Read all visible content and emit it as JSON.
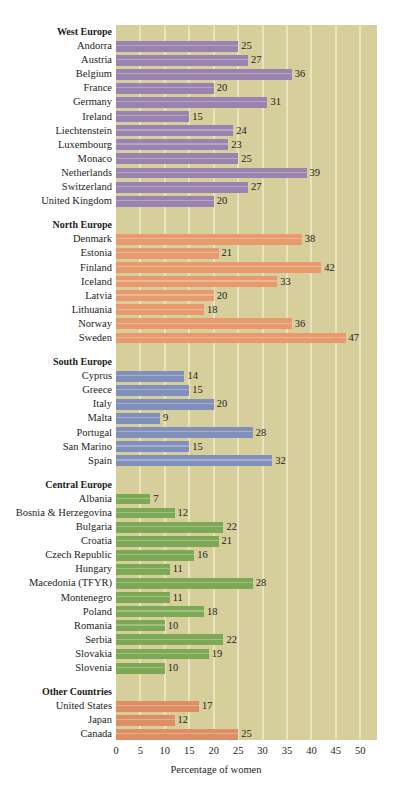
{
  "chart_data": {
    "type": "bar",
    "orientation": "horizontal",
    "title": "",
    "xlabel": "Percentage of women",
    "ylabel": "",
    "xlim": [
      0,
      50
    ],
    "xticks": [
      0,
      5,
      10,
      15,
      20,
      25,
      30,
      35,
      40,
      45,
      50
    ],
    "grid": "vertical",
    "legend": "none",
    "value_suffix": "",
    "colors": {
      "west": "#9b83b0",
      "north": "#e79a6e",
      "south": "#8190bb",
      "central": "#7da855",
      "other": "#dd8f63",
      "plot_background": "#d6cf9c",
      "gridline": "#e9e4bd",
      "page_background": "#ffffff",
      "text": "#1d1d1b"
    },
    "groups": [
      {
        "name": "West Europe",
        "key": "west",
        "categories": [
          "Andorra",
          "Austria",
          "Belgium",
          "France",
          "Germany",
          "Ireland",
          "Liechtenstein",
          "Luxembourg",
          "Monaco",
          "Netherlands",
          "Switzerland",
          "United Kingdom"
        ],
        "values": [
          25,
          27,
          36,
          20,
          31,
          15,
          24,
          23,
          25,
          39,
          27,
          20
        ]
      },
      {
        "name": "North Europe",
        "key": "north",
        "categories": [
          "Denmark",
          "Estonia",
          "Finland",
          "Iceland",
          "Latvia",
          "Lithuania",
          "Norway",
          "Sweden"
        ],
        "values": [
          38,
          21,
          42,
          33,
          20,
          18,
          36,
          47
        ]
      },
      {
        "name": "South Europe",
        "key": "south",
        "categories": [
          "Cyprus",
          "Greece",
          "Italy",
          "Malta",
          "Portugal",
          "San Marino",
          "Spain"
        ],
        "values": [
          14,
          15,
          20,
          9,
          28,
          15,
          32
        ]
      },
      {
        "name": "Central Europe",
        "key": "central",
        "categories": [
          "Albania",
          "Bosnia & Herzegovina",
          "Bulgaria",
          "Croatia",
          "Czech Republic",
          "Hungary",
          "Macedonia (TFYR)",
          "Montenegro",
          "Poland",
          "Romania",
          "Serbia",
          "Slovakia",
          "Slovenia"
        ],
        "values": [
          7,
          12,
          22,
          21,
          16,
          11,
          28,
          11,
          18,
          10,
          22,
          19,
          10
        ]
      },
      {
        "name": "Other Countries",
        "key": "other",
        "categories": [
          "United States",
          "Japan",
          "Canada"
        ],
        "values": [
          17,
          12,
          25
        ]
      }
    ]
  }
}
